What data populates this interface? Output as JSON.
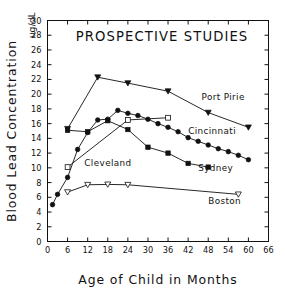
{
  "chart_data": {
    "type": "line",
    "title": "PROSPECTIVE STUDIES",
    "xlabel": "Age of Child in Months",
    "ylabel": "Blood Lead Concentration",
    "units": "ug/dL",
    "xlim": [
      0,
      66
    ],
    "ylim": [
      0,
      30
    ],
    "xticks": [
      0,
      6,
      12,
      18,
      24,
      30,
      36,
      42,
      48,
      54,
      60,
      66
    ],
    "yticks": [
      0,
      2,
      4,
      6,
      8,
      10,
      12,
      14,
      16,
      18,
      20,
      22,
      24,
      26,
      28,
      30
    ],
    "grid": false,
    "legend": "inline-labels",
    "series": [
      {
        "name": "Port Pirie",
        "marker": "filled-triangle-down",
        "label_x": 46,
        "label_y": 19.2,
        "points": [
          [
            6,
            15.3
          ],
          [
            15,
            22.3
          ],
          [
            24,
            21.5
          ],
          [
            36,
            20.4
          ],
          [
            48,
            17.5
          ],
          [
            60,
            15.5
          ]
        ]
      },
      {
        "name": "Cincinnati",
        "marker": "filled-circle",
        "label_x": 42,
        "label_y": 14.6,
        "points": [
          [
            1.5,
            5.0
          ],
          [
            3,
            6.4
          ],
          [
            6,
            8.7
          ],
          [
            9,
            12.5
          ],
          [
            12,
            14.8
          ],
          [
            15,
            16.5
          ],
          [
            18,
            16.6
          ],
          [
            21,
            17.8
          ],
          [
            24,
            17.4
          ],
          [
            27,
            17.1
          ],
          [
            30,
            16.6
          ],
          [
            33,
            16.0
          ],
          [
            36,
            15.5
          ],
          [
            39,
            14.9
          ],
          [
            42,
            14.1
          ],
          [
            45,
            13.6
          ],
          [
            48,
            13.1
          ],
          [
            51,
            12.6
          ],
          [
            54,
            12.2
          ],
          [
            57,
            11.7
          ],
          [
            60,
            11.1
          ]
        ]
      },
      {
        "name": "Cleveland",
        "marker": "open-square",
        "label_x": 11,
        "label_y": 10.2,
        "points": [
          [
            6,
            10.1
          ],
          [
            24,
            16.5
          ],
          [
            36,
            16.8
          ]
        ]
      },
      {
        "name": "Sydney",
        "marker": "filled-square",
        "label_x": 45,
        "label_y": 9.6,
        "points": [
          [
            6,
            15.1
          ],
          [
            12,
            14.9
          ],
          [
            18,
            16.4
          ],
          [
            24,
            15.2
          ],
          [
            30,
            12.8
          ],
          [
            36,
            12.0
          ],
          [
            42,
            10.6
          ],
          [
            48,
            10.1
          ]
        ]
      },
      {
        "name": "Boston",
        "marker": "open-triangle-down",
        "label_x": 48,
        "label_y": 5.1,
        "points": [
          [
            6,
            6.7
          ],
          [
            12,
            7.7
          ],
          [
            18,
            7.75
          ],
          [
            24,
            7.7
          ],
          [
            57,
            6.4
          ]
        ]
      }
    ]
  }
}
